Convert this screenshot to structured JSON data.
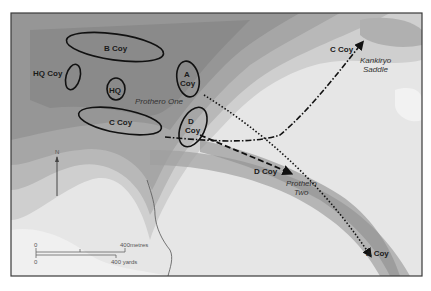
{
  "map": {
    "frame_color": "#3a3a3a",
    "units": [
      {
        "id": "b-coy",
        "label": "B Coy"
      },
      {
        "id": "hq-coy",
        "label": "HQ Coy"
      },
      {
        "id": "hq",
        "label": "HQ"
      },
      {
        "id": "a-coy",
        "label_line1": "A",
        "label_line2": "Coy"
      },
      {
        "id": "c-coy",
        "label": "C Coy"
      },
      {
        "id": "d-coy",
        "label_line1": "D",
        "label_line2": "Coy"
      }
    ],
    "places": {
      "prothero_one": "Prothero One",
      "prothero_two_line1": "Prothero",
      "prothero_two_line2": "Two",
      "kankiryo_line1": "Kankiryo",
      "kankiryo_line2": "Saddle"
    },
    "arrows": {
      "c_coy": "C Coy",
      "d_coy": "D Coy",
      "a_coy": "A Coy"
    },
    "north": "N",
    "scale": {
      "metres_zero": "0",
      "metres_label": "400metres",
      "yards_zero": "0",
      "yards_label": "400 yards"
    }
  }
}
